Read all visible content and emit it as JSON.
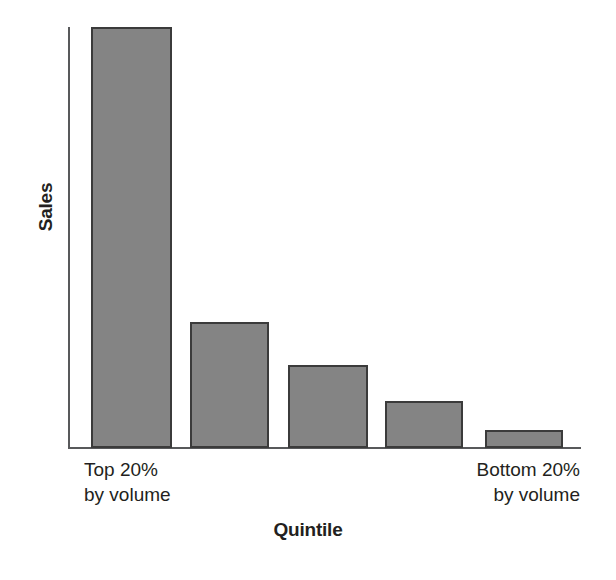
{
  "chart_data": {
    "type": "bar",
    "title": "",
    "subtitle": "",
    "xlabel": "Quintile",
    "ylabel": "Sales",
    "categories": [
      "Top 20% by volume",
      "2nd quintile",
      "3rd quintile",
      "4th quintile",
      "Bottom 20% by volume"
    ],
    "values": [
      100,
      29.9,
      19.6,
      11.2,
      4.3
    ],
    "ylim": [
      0,
      100
    ],
    "grid": false,
    "legend": null,
    "axis_tick_labels": {
      "x": [],
      "y": []
    },
    "annotations": [
      {
        "text": "Top 20%",
        "position": "below-first-bar"
      },
      {
        "text": "by volume",
        "position": "below-first-bar"
      },
      {
        "text": "Bottom 20%",
        "position": "below-last-bar"
      },
      {
        "text": "by volume",
        "position": "below-last-bar"
      }
    ],
    "colors": {
      "bar_fill": "#848484",
      "bar_stroke": "#3b3b3b",
      "axis": "#58595b",
      "text": "#231f20",
      "background": "#ffffff"
    }
  },
  "axis_titles": {
    "y": "Sales",
    "x": "Quintile"
  },
  "category_labels": {
    "first": {
      "line1": "Top 20%",
      "line2": "by volume"
    },
    "last": {
      "line1": "Bottom 20%",
      "line2": "by volume"
    }
  },
  "bars": [
    {
      "name": "bar-quintile-1",
      "left": 23,
      "width": 81,
      "height_pct": 100.0
    },
    {
      "name": "bar-quintile-2",
      "left": 122,
      "width": 79,
      "height_pct": 29.9
    },
    {
      "name": "bar-quintile-3",
      "left": 220,
      "width": 80,
      "height_pct": 19.6
    },
    {
      "name": "bar-quintile-4",
      "left": 317,
      "width": 78,
      "height_pct": 11.2
    },
    {
      "name": "bar-quintile-5",
      "left": 417,
      "width": 78,
      "height_pct": 4.3
    }
  ]
}
